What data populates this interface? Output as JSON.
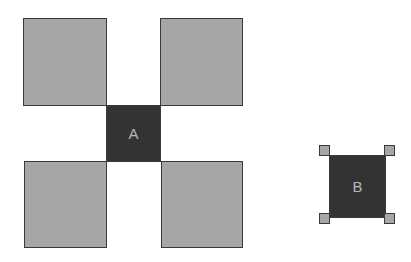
{
  "diagram": {
    "colors": {
      "light_fill": "#a6a6a6",
      "dark_fill": "#333333",
      "stroke": "#3a3a3a",
      "label_color": "#b8b8b8",
      "background": "#ffffff"
    },
    "left_group": {
      "center_box": {
        "label": "A"
      },
      "corner_boxes": [
        "top-left",
        "top-right",
        "bottom-left",
        "bottom-right"
      ]
    },
    "right_group": {
      "center_box": {
        "label": "B"
      },
      "corner_handles": [
        "top-left",
        "top-right",
        "bottom-left",
        "bottom-right"
      ]
    }
  }
}
